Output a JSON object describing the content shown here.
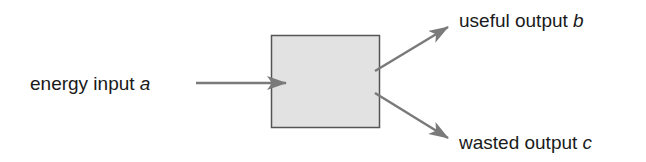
{
  "diagram": {
    "type": "energy-flow",
    "box": {
      "fill": "#e2e2e2",
      "stroke": "#555555"
    },
    "arrow_color": "#7a7a7a",
    "input": {
      "text": "energy input",
      "var": "a"
    },
    "outputs": [
      {
        "text": "useful output",
        "var": "b"
      },
      {
        "text": "wasted output",
        "var": "c"
      }
    ]
  }
}
